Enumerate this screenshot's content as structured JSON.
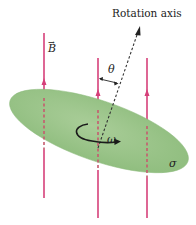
{
  "figure": {
    "labels": {
      "rotation_axis": "Rotation axis",
      "field": "B",
      "field_vector_mark": "→",
      "angle": "θ",
      "angular_velocity": "ω",
      "surface_charge": "σ"
    },
    "colors": {
      "field_lines": "#d6407a",
      "disk_fill": "#9dc48c",
      "disk_edge": "#86b476",
      "axis": "#333333",
      "rotation_arrow": "#1a1a1a"
    },
    "field_lines_count": 3
  }
}
